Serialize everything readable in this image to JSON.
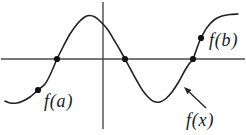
{
  "figure": {
    "width": 246,
    "height": 135,
    "background": "#ffffff",
    "colors": {
      "axis": "#4a4a4a",
      "curve": "#222222",
      "point": "#111111",
      "text": "#1a1a1a"
    }
  },
  "chart_data": {
    "type": "line",
    "title": "",
    "xlabel": "",
    "ylabel": "",
    "grid": false,
    "ticks": "none",
    "axes": {
      "x_axis": {
        "y": 59,
        "x1": 1,
        "x2": 245
      },
      "y_axis": {
        "x": 103,
        "y1": 2,
        "y2": 129
      }
    },
    "curve_points": [
      [
        5,
        101
      ],
      [
        10,
        103
      ],
      [
        17,
        103
      ],
      [
        23,
        101
      ],
      [
        30,
        97
      ],
      [
        38,
        90
      ],
      [
        45,
        84
      ],
      [
        51,
        73
      ],
      [
        57,
        59
      ],
      [
        63,
        47
      ],
      [
        70,
        34
      ],
      [
        78,
        23
      ],
      [
        84,
        17.5
      ],
      [
        89,
        15.5
      ],
      [
        95,
        17
      ],
      [
        101,
        22
      ],
      [
        108,
        30
      ],
      [
        114,
        40
      ],
      [
        120,
        50
      ],
      [
        125,
        59
      ],
      [
        131,
        70
      ],
      [
        137,
        81
      ],
      [
        143,
        91
      ],
      [
        149,
        98
      ],
      [
        154,
        101.5
      ],
      [
        160,
        102
      ],
      [
        166,
        98.5
      ],
      [
        172,
        92
      ],
      [
        178,
        83
      ],
      [
        184,
        72
      ],
      [
        189,
        64
      ],
      [
        193,
        59
      ],
      [
        197,
        48
      ],
      [
        201,
        38
      ],
      [
        207,
        27.5
      ],
      [
        214,
        20
      ],
      [
        222,
        16
      ],
      [
        230,
        14.5
      ],
      [
        238,
        14
      ]
    ],
    "marked_points": [
      {
        "x": 38,
        "y": 90,
        "label": "f(a)"
      },
      {
        "x": 57,
        "y": 59,
        "label": ""
      },
      {
        "x": 125,
        "y": 59,
        "label": ""
      },
      {
        "x": 193,
        "y": 59,
        "label": ""
      },
      {
        "x": 201,
        "y": 38,
        "label": "f(b)"
      }
    ],
    "arrow": {
      "x1": 206,
      "y1": 108,
      "x2": 184,
      "y2": 87,
      "points_to": "f(x)"
    }
  },
  "labels": {
    "f_a": {
      "text": "f(a)",
      "x": 44,
      "y": 107
    },
    "f_b": {
      "text": "f(b)",
      "x": 209,
      "y": 46
    },
    "f_x": {
      "text": "f(x)",
      "x": 186,
      "y": 126
    }
  }
}
